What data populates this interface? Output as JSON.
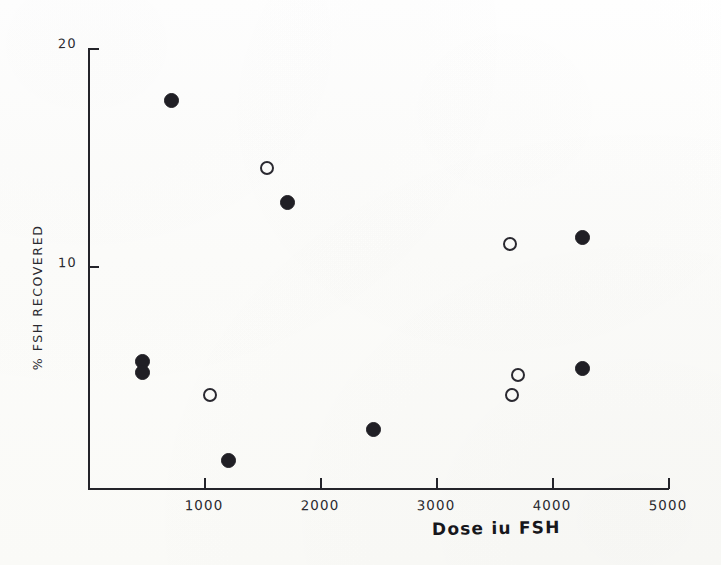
{
  "figure": {
    "background_color": "#fdfdfb",
    "ink_color": "#24242a"
  },
  "chart_data": {
    "type": "scatter",
    "title": "",
    "xlabel": "Dose iu FSH",
    "ylabel": "% FSH RECOVERED",
    "xlim": [
      0,
      5000
    ],
    "ylim": [
      0,
      20
    ],
    "grid": false,
    "legend_position": "none",
    "xticks": [
      1000,
      2000,
      3000,
      4000,
      5000
    ],
    "xtick_labels": [
      "1000",
      "2000",
      "3000",
      "4000",
      "5000"
    ],
    "yticks": [
      10,
      20
    ],
    "ytick_labels": [
      "10",
      "20"
    ],
    "series": [
      {
        "name": "filled",
        "marker": "filled-circle",
        "color": "#201f25",
        "points": [
          {
            "x": 724,
            "y": 17.6
          },
          {
            "x": 1716,
            "y": 12.9
          },
          {
            "x": 4259,
            "y": 11.3
          },
          {
            "x": 466,
            "y": 5.6
          },
          {
            "x": 466,
            "y": 5.1
          },
          {
            "x": 1207,
            "y": 1.1
          },
          {
            "x": 2457,
            "y": 2.5
          },
          {
            "x": 4259,
            "y": 5.3
          }
        ]
      },
      {
        "name": "open",
        "marker": "open-circle",
        "color": "#2a2930",
        "points": [
          {
            "x": 1543,
            "y": 14.5
          },
          {
            "x": 3638,
            "y": 11.0
          },
          {
            "x": 1052,
            "y": 4.1
          },
          {
            "x": 3707,
            "y": 5.0
          },
          {
            "x": 3655,
            "y": 4.1
          }
        ]
      }
    ]
  },
  "axis": {
    "x_title": "Dose iu FSH",
    "y_title": "% FSH  RECOVERED",
    "x_tick_labels": [
      "1000",
      "2000",
      "3000",
      "4000",
      "5000"
    ],
    "y_tick_label_top": "20",
    "y_tick_label_mid": "10"
  }
}
